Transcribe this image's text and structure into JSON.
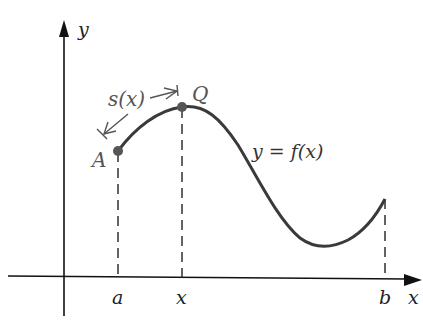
{
  "figure": {
    "axes": {
      "x_label": "x",
      "y_label": "y"
    },
    "ticks": {
      "a": "a",
      "x": "x",
      "b": "b"
    },
    "points": {
      "A": "A",
      "Q": "Q"
    },
    "arc_length_label": "s(x)",
    "curve_label": "y = f(x)",
    "colors": {
      "axis": "#111111",
      "curve": "#3a3a3a",
      "points": "#555555",
      "labels_gray": "#555555"
    }
  }
}
